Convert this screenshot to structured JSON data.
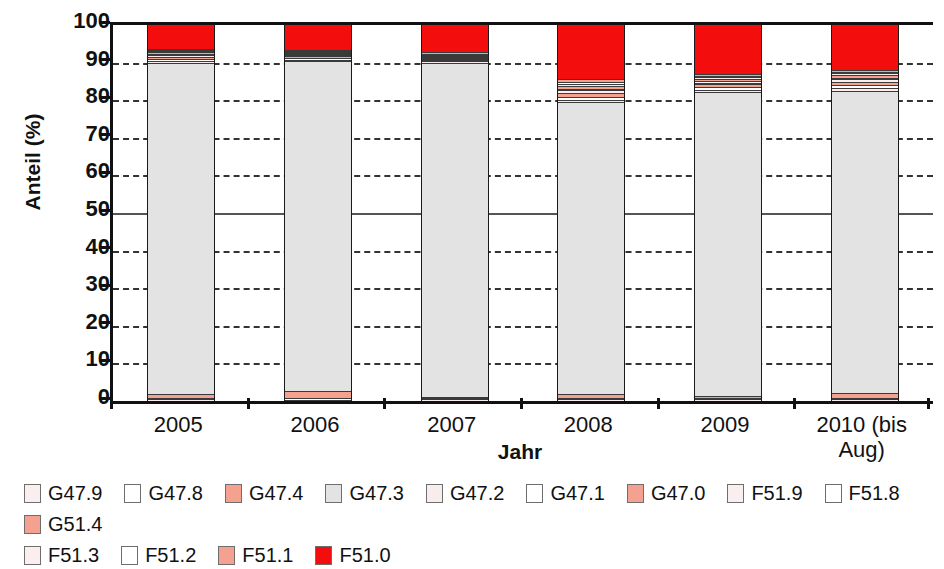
{
  "chart_data": {
    "type": "bar",
    "subtype": "stacked-100-percent",
    "title": "",
    "xlabel": "Jahr",
    "ylabel": "Anteil (%)",
    "ylim": [
      0,
      100
    ],
    "yticks": [
      0,
      10,
      20,
      30,
      40,
      50,
      60,
      70,
      80,
      90,
      100
    ],
    "grid": "horizontal-dashed",
    "legend_position": "bottom",
    "categories": [
      "2005",
      "2006",
      "2007",
      "2008",
      "2009",
      "2010 (bis Aug)"
    ],
    "series": [
      {
        "name": "G47.9",
        "color": "#fbeeee",
        "values": [
          0.5,
          0.4,
          0.5,
          0.4,
          0.5,
          0.5
        ]
      },
      {
        "name": "G47.8",
        "color": "#ffffff",
        "values": [
          0.3,
          0.3,
          0.3,
          0.3,
          0.3,
          0.3
        ]
      },
      {
        "name": "G47.4",
        "color": "#f4a28f",
        "values": [
          1.0,
          2.0,
          0.4,
          1.2,
          0.6,
          1.2
        ]
      },
      {
        "name": "G47.3",
        "color": "#e3e3e3",
        "values": [
          88.2,
          88.0,
          89.0,
          77.5,
          80.8,
          80.5
        ]
      },
      {
        "name": "G47.2",
        "color": "#f7eded",
        "values": [
          0.4,
          0.3,
          0.3,
          0.6,
          0.5,
          0.6
        ]
      },
      {
        "name": "G47.1",
        "color": "#ffffff",
        "values": [
          0.6,
          0.4,
          0.3,
          0.9,
          0.7,
          0.8
        ]
      },
      {
        "name": "G47.0",
        "color": "#f4a28f",
        "values": [
          0.6,
          0.5,
          0.4,
          1.0,
          0.8,
          1.0
        ]
      },
      {
        "name": "F51.9",
        "color": "#fbeeee",
        "values": [
          0.4,
          0.3,
          0.3,
          0.7,
          0.5,
          0.6
        ]
      },
      {
        "name": "F51.8",
        "color": "#ffffff",
        "values": [
          0.3,
          0.2,
          0.2,
          0.5,
          0.4,
          0.5
        ]
      },
      {
        "name": "G51.4",
        "color": "#f4a28f",
        "values": [
          0.4,
          0.3,
          0.3,
          0.8,
          0.6,
          0.7
        ]
      },
      {
        "name": "F51.3",
        "color": "#fbeeee",
        "values": [
          0.3,
          0.2,
          0.2,
          0.5,
          0.4,
          0.4
        ]
      },
      {
        "name": "F51.2",
        "color": "#ffffff",
        "values": [
          0.3,
          0.2,
          0.2,
          0.5,
          0.4,
          0.4
        ]
      },
      {
        "name": "F51.1",
        "color": "#f4a28f",
        "values": [
          0.4,
          0.3,
          0.3,
          0.7,
          0.6,
          0.6
        ]
      },
      {
        "name": "F51.0",
        "color": "#f40d0d",
        "values": [
          6.3,
          6.6,
          7.3,
          14.4,
          12.9,
          11.9
        ]
      }
    ]
  },
  "axis": {
    "y_title": "Anteil (%)",
    "x_title": "Jahr",
    "y_tick_labels": [
      "100",
      "90",
      "80",
      "70",
      "60",
      "50",
      "40",
      "30",
      "20",
      "10",
      "0"
    ],
    "x_tick_labels": [
      "2005",
      "2006",
      "2007",
      "2008",
      "2009",
      "2010 (bis\nAug)"
    ]
  },
  "legend": {
    "items": [
      {
        "label": "G47.9",
        "color": "#fbeeee"
      },
      {
        "label": "G47.8",
        "color": "#ffffff"
      },
      {
        "label": "G47.4",
        "color": "#f4a28f"
      },
      {
        "label": "G47.3",
        "color": "#e3e3e3"
      },
      {
        "label": "G47.2",
        "color": "#f7eded"
      },
      {
        "label": "G47.1",
        "color": "#ffffff"
      },
      {
        "label": "G47.0",
        "color": "#f4a28f"
      },
      {
        "label": "F51.9",
        "color": "#fbeeee"
      },
      {
        "label": "F51.8",
        "color": "#ffffff"
      },
      {
        "label": "G51.4",
        "color": "#f4a28f"
      },
      {
        "label": "F51.3",
        "color": "#fbeeee"
      },
      {
        "label": "F51.2",
        "color": "#ffffff"
      },
      {
        "label": "F51.1",
        "color": "#f4a28f"
      },
      {
        "label": "F51.0",
        "color": "#f40d0d"
      }
    ]
  }
}
